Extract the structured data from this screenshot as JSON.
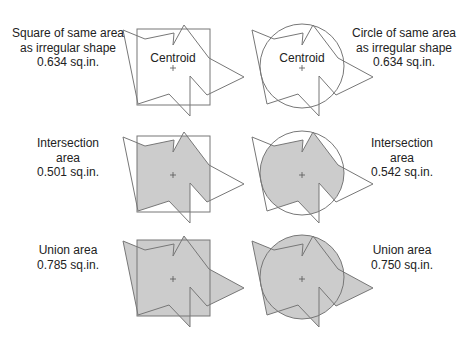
{
  "colors": {
    "stroke": "#777777",
    "fill": "#cccccc",
    "text": "#222222"
  },
  "centroid_label": "Centroid",
  "rows": [
    {
      "left": {
        "lines": [
          "Square of same area",
          "as irregular shape",
          "0.634 sq.in."
        ]
      },
      "right": {
        "lines": [
          "Circle of same area",
          "as irregular shape",
          "0.634 sq.in."
        ]
      },
      "mode": "outline"
    },
    {
      "left": {
        "lines": [
          "Intersection",
          "area",
          "0.501 sq.in."
        ]
      },
      "right": {
        "lines": [
          "Intersection",
          "area",
          "0.542 sq.in."
        ]
      },
      "mode": "intersection"
    },
    {
      "left": {
        "lines": [
          "Union area",
          "0.785 sq.in."
        ]
      },
      "right": {
        "lines": [
          "Union area",
          "0.750 sq.in."
        ]
      },
      "mode": "union"
    }
  ]
}
